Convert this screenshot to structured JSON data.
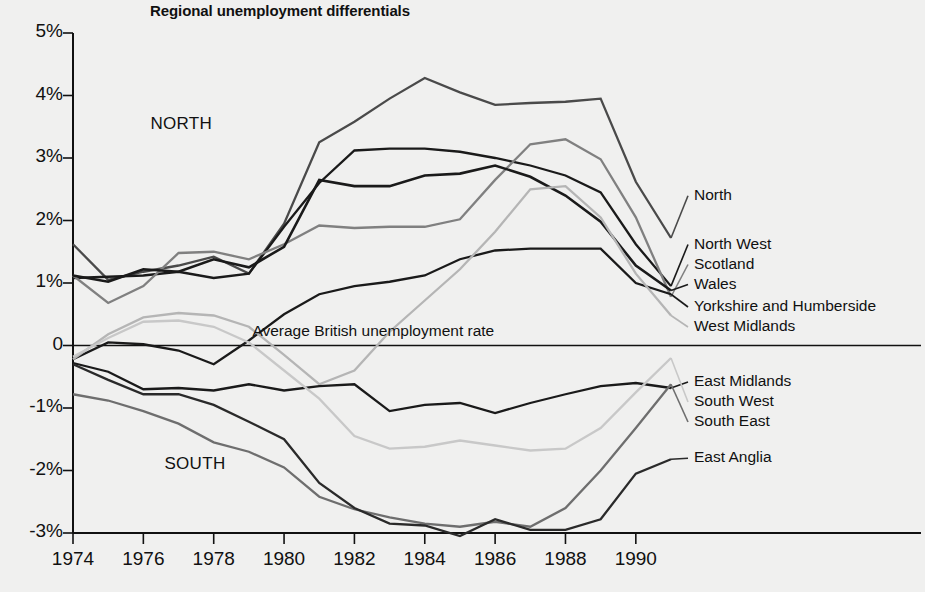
{
  "chart_data": {
    "type": "line",
    "title": "Regional unemployment differentials",
    "xlabel": "",
    "ylabel": "",
    "xlim": [
      1974,
      1991
    ],
    "ylim": [
      -3,
      5
    ],
    "grid": false,
    "legend_position": "right-inline",
    "x": [
      1974,
      1975,
      1976,
      1977,
      1978,
      1979,
      1980,
      1981,
      1982,
      1983,
      1984,
      1985,
      1986,
      1987,
      1988,
      1989,
      1990,
      1991
    ],
    "x_tick_labels": [
      "1974",
      "1976",
      "1978",
      "1980",
      "1982",
      "1984",
      "1986",
      "1988",
      "1990"
    ],
    "x_ticks": [
      1974,
      1976,
      1978,
      1980,
      1982,
      1984,
      1986,
      1988,
      1990
    ],
    "y_tick_labels": [
      "5%",
      "4%",
      "3%",
      "2%",
      "1%",
      "0",
      "-1%",
      "-2%",
      "-3%"
    ],
    "y_ticks": [
      5,
      4,
      3,
      2,
      1,
      0,
      -1,
      -2,
      -3
    ],
    "annotations": [
      {
        "text": "NORTH",
        "x": 1976.2,
        "y": 3.55
      },
      {
        "text": "SOUTH",
        "x": 1976.6,
        "y": -1.9
      },
      {
        "text": "Average British unemployment rate",
        "x": 1979.1,
        "y": 0.22
      }
    ],
    "series": [
      {
        "name": "North",
        "color": "#4a4a4a",
        "width": 2.3,
        "values": [
          1.62,
          1.05,
          1.18,
          1.28,
          1.42,
          1.15,
          1.95,
          3.25,
          3.58,
          3.95,
          4.28,
          4.05,
          3.85,
          3.88,
          3.9,
          3.95,
          2.62,
          1.72
        ]
      },
      {
        "name": "North West",
        "color": "#1a1a1a",
        "width": 2.3,
        "values": [
          1.08,
          1.1,
          1.12,
          1.18,
          1.08,
          1.15,
          1.9,
          2.6,
          3.12,
          3.15,
          3.15,
          3.1,
          3.0,
          2.88,
          2.72,
          2.45,
          1.62,
          0.95
        ]
      },
      {
        "name": "Scotland",
        "color": "#808080",
        "width": 2.3,
        "values": [
          1.12,
          0.68,
          0.95,
          1.48,
          1.5,
          1.38,
          1.62,
          1.92,
          1.88,
          1.9,
          1.9,
          2.02,
          2.65,
          3.22,
          3.3,
          2.98,
          2.05,
          0.78
        ]
      },
      {
        "name": "Wales",
        "color": "#1a1a1a",
        "width": 2.6,
        "values": [
          1.12,
          1.02,
          1.22,
          1.18,
          1.38,
          1.25,
          1.58,
          2.65,
          2.55,
          2.55,
          2.72,
          2.75,
          2.88,
          2.7,
          2.4,
          1.98,
          1.28,
          0.88
        ]
      },
      {
        "name": "Yorkshire and Humberside",
        "color": "#1a1a1a",
        "width": 2.3,
        "values": [
          -0.22,
          0.05,
          0.02,
          -0.08,
          -0.3,
          0.08,
          0.5,
          0.82,
          0.95,
          1.02,
          1.12,
          1.38,
          1.52,
          1.55,
          1.55,
          1.55,
          1.0,
          0.82
        ]
      },
      {
        "name": "West Midlands",
        "color": "#b5b5b5",
        "width": 2.3,
        "values": [
          -0.22,
          0.18,
          0.45,
          0.52,
          0.48,
          0.3,
          -0.15,
          -0.62,
          -0.4,
          0.22,
          0.72,
          1.22,
          1.82,
          2.5,
          2.55,
          2.05,
          1.15,
          0.48
        ]
      },
      {
        "name": "East Midlands",
        "color": "#1a1a1a",
        "width": 2.3,
        "values": [
          -0.28,
          -0.42,
          -0.7,
          -0.68,
          -0.72,
          -0.62,
          -0.72,
          -0.65,
          -0.62,
          -1.05,
          -0.95,
          -0.92,
          -1.08,
          -0.92,
          -0.78,
          -0.65,
          -0.6,
          -0.68
        ]
      },
      {
        "name": "South West",
        "color": "#c8c8c8",
        "width": 2.3,
        "values": [
          -0.18,
          0.12,
          0.38,
          0.4,
          0.3,
          0.05,
          -0.4,
          -0.85,
          -1.45,
          -1.65,
          -1.62,
          -1.52,
          -1.6,
          -1.68,
          -1.65,
          -1.32,
          -0.75,
          -0.2
        ]
      },
      {
        "name": "South East",
        "color": "#6e6e6e",
        "width": 2.3,
        "values": [
          -0.78,
          -0.88,
          -1.05,
          -1.25,
          -1.55,
          -1.7,
          -1.95,
          -2.42,
          -2.62,
          -2.75,
          -2.85,
          -2.9,
          -2.82,
          -2.9,
          -2.6,
          -2.0,
          -1.32,
          -0.62
        ]
      },
      {
        "name": "East Anglia",
        "color": "#2a2a2a",
        "width": 2.3,
        "values": [
          -0.3,
          -0.55,
          -0.78,
          -0.78,
          -0.95,
          -1.22,
          -1.5,
          -2.2,
          -2.6,
          -2.85,
          -2.88,
          -3.05,
          -2.78,
          -2.95,
          -2.95,
          -2.78,
          -2.05,
          -1.82
        ]
      }
    ],
    "right_labels": [
      {
        "name": "North",
        "y_label": 2.3
      },
      {
        "name": "North West",
        "y_label": 1.52
      },
      {
        "name": "Scotland",
        "y_label": 1.2
      },
      {
        "name": "Wales",
        "y_label": 0.88
      },
      {
        "name": "Yorkshire and Humberside",
        "y_label": 0.52
      },
      {
        "name": "West Midlands",
        "y_label": 0.2
      },
      {
        "name": "East Midlands",
        "y_label": -0.68
      },
      {
        "name": "South West",
        "y_label": -1.0
      },
      {
        "name": "South East",
        "y_label": -1.32
      },
      {
        "name": "East Anglia",
        "y_label": -1.9
      }
    ]
  }
}
